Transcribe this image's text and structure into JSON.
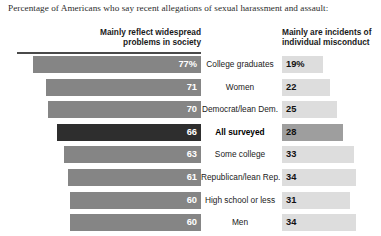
{
  "title": "Percentage of Americans who say recent allegations of sexual harassment and assault:",
  "headers": {
    "left": "Mainly reflect widespread problems in society",
    "right": "Mainly are incidents of individual misconduct"
  },
  "colors": {
    "bar_left": "#858585",
    "bar_left_highlight": "#2e2e2e",
    "bar_right": "#dddddd",
    "bar_right_highlight": "#9e9e9e",
    "rule": "#4a4a4a",
    "text": "#222222"
  },
  "chart_data": {
    "type": "bar",
    "title": "Percentage of Americans who say recent allegations of sexual harassment and assault:",
    "xlabel": "",
    "ylabel": "",
    "grid": false,
    "legend": "none",
    "orientation": "horizontal",
    "layout": "diverging-pair",
    "categories": [
      "College graduates",
      "Women",
      "Democrat/lean Dem.",
      "All surveyed",
      "Some college",
      "Republican/lean Rep.",
      "High school or less",
      "Men"
    ],
    "series": [
      {
        "name": "Mainly reflect widespread problems in society",
        "values": [
          77,
          71,
          70,
          66,
          63,
          61,
          60,
          60
        ],
        "labels": [
          "77%",
          "71",
          "70",
          "66",
          "63",
          "61",
          "60",
          "60"
        ]
      },
      {
        "name": "Mainly are incidents of individual misconduct",
        "values": [
          19,
          22,
          25,
          28,
          33,
          34,
          31,
          34
        ],
        "labels": [
          "19%",
          "22",
          "25",
          "28",
          "33",
          "34",
          "31",
          "34"
        ]
      }
    ],
    "highlight_category": "All surveyed",
    "xlim": [
      0,
      100
    ]
  },
  "rows": [
    {
      "label": "College graduates",
      "left_value": 77,
      "left_label": "77%",
      "right_value": 19,
      "right_label": "19%",
      "highlight": false
    },
    {
      "label": "Women",
      "left_value": 71,
      "left_label": "71",
      "right_value": 22,
      "right_label": "22",
      "highlight": false
    },
    {
      "label": "Democrat/lean Dem.",
      "left_value": 70,
      "left_label": "70",
      "right_value": 25,
      "right_label": "25",
      "highlight": false
    },
    {
      "label": "All surveyed",
      "left_value": 66,
      "left_label": "66",
      "right_value": 28,
      "right_label": "28",
      "highlight": true
    },
    {
      "label": "Some college",
      "left_value": 63,
      "left_label": "63",
      "right_value": 33,
      "right_label": "33",
      "highlight": false
    },
    {
      "label": "Republican/lean Rep.",
      "left_value": 61,
      "left_label": "61",
      "right_value": 34,
      "right_label": "34",
      "highlight": false
    },
    {
      "label": "High school or less",
      "left_value": 60,
      "left_label": "60",
      "right_value": 31,
      "right_label": "31",
      "highlight": false
    },
    {
      "label": "Men",
      "left_value": 60,
      "left_label": "60",
      "right_value": 34,
      "right_label": "34",
      "highlight": false
    }
  ]
}
